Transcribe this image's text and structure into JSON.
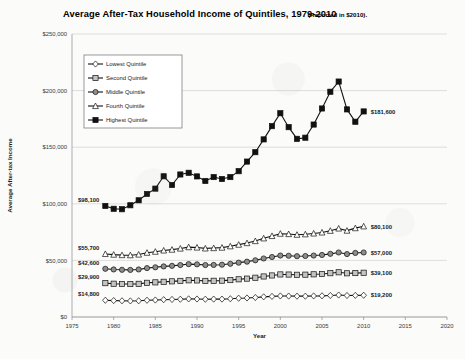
{
  "chart_data": {
    "type": "line",
    "title": "Average After-Tax Household Income of Quintiles, 1979-2010",
    "subtitle": "(Reported in $2010).",
    "xlabel": "Year",
    "ylabel": "Average After-tax Income",
    "xlim": [
      1975,
      2020
    ],
    "ylim": [
      0,
      250000
    ],
    "xticks": [
      "1975",
      "1980",
      "1985",
      "1990",
      "1995",
      "2000",
      "2005",
      "2010",
      "2015",
      "2020"
    ],
    "xtick_values": [
      1975,
      1980,
      1985,
      1990,
      1995,
      2000,
      2005,
      2010,
      2015,
      2020
    ],
    "yticks": [
      "$0",
      "$50,000",
      "$100,000",
      "$150,000",
      "$200,000",
      "$250,000"
    ],
    "ytick_values": [
      0,
      50000,
      100000,
      150000,
      200000,
      250000
    ],
    "grid": true,
    "legend_position": "upper-left-inside",
    "x": [
      1979,
      1980,
      1981,
      1982,
      1983,
      1984,
      1985,
      1986,
      1987,
      1988,
      1989,
      1990,
      1991,
      1992,
      1993,
      1994,
      1995,
      1996,
      1997,
      1998,
      1999,
      2000,
      2001,
      2002,
      2003,
      2004,
      2005,
      2006,
      2007,
      2008,
      2009,
      2010
    ],
    "series": [
      {
        "name": "Lowest Quintile",
        "marker": "diamond-open",
        "start_label": "$14,800",
        "end_label": "$19,200",
        "values": [
          14800,
          14500,
          14300,
          14200,
          14300,
          14800,
          15000,
          15300,
          15500,
          15700,
          16000,
          15900,
          15700,
          15800,
          15800,
          16100,
          16600,
          16800,
          17200,
          17800,
          18200,
          18600,
          18500,
          18400,
          18400,
          18600,
          18700,
          19000,
          19400,
          19000,
          19100,
          19200
        ]
      },
      {
        "name": "Second Quintile",
        "marker": "square-gray",
        "start_label": "$29,900",
        "end_label": "$39,100",
        "values": [
          29900,
          29400,
          29200,
          29100,
          29300,
          30200,
          30600,
          31100,
          31500,
          31900,
          32400,
          32300,
          31900,
          32000,
          32100,
          32600,
          33300,
          33900,
          34700,
          35800,
          36700,
          37600,
          37500,
          37300,
          37400,
          37700,
          38000,
          38700,
          39500,
          38600,
          38800,
          39100
        ]
      },
      {
        "name": "Middle Quintile",
        "marker": "circle-gray",
        "start_label": "$42,600",
        "end_label": "$57,000",
        "values": [
          42600,
          42000,
          41700,
          41600,
          42000,
          43200,
          43900,
          44700,
          45200,
          45900,
          46700,
          46500,
          45900,
          46000,
          46200,
          47000,
          48000,
          48900,
          50100,
          51700,
          53000,
          54300,
          54100,
          53700,
          53900,
          54300,
          54800,
          55800,
          57000,
          55600,
          56600,
          57000
        ]
      },
      {
        "name": "Fourth Quintile",
        "marker": "triangle-open",
        "start_label": "$55,700",
        "end_label": "$80,100",
        "values": [
          55700,
          55100,
          54700,
          54600,
          55200,
          56800,
          57700,
          58800,
          59500,
          60500,
          61700,
          61400,
          60600,
          60900,
          61300,
          62500,
          63900,
          65300,
          67100,
          69500,
          71600,
          73600,
          73300,
          72700,
          73100,
          73800,
          74700,
          76200,
          78200,
          76300,
          78500,
          80100
        ]
      },
      {
        "name": "Highest Quintile",
        "marker": "square-filled",
        "start_label": "$98,100",
        "end_label": "$181,600",
        "values": [
          98100,
          95600,
          95200,
          98700,
          103100,
          108700,
          113400,
          124300,
          116600,
          125900,
          127400,
          124200,
          120200,
          123600,
          121900,
          123600,
          128800,
          137300,
          145600,
          156900,
          168600,
          180000,
          167700,
          157400,
          158400,
          170000,
          184200,
          199000,
          208000,
          183400,
          172500,
          181600
        ]
      }
    ]
  }
}
